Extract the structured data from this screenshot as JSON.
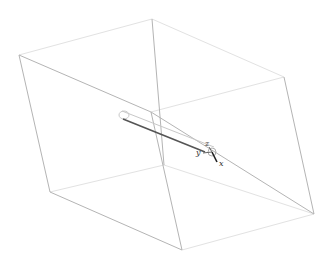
{
  "scene": {
    "type": "3d-wireframe-box",
    "background": "#ffffff",
    "edge_color": "#b4b4b4",
    "hidden_edge_color": "#e2e2e2"
  },
  "triad": {
    "x_label": "x",
    "y_label": "y",
    "z_label": "z"
  }
}
